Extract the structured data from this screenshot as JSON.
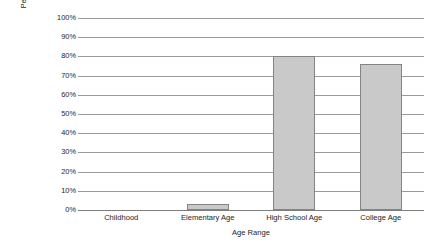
{
  "chart_data": {
    "type": "bar",
    "title": "",
    "subtitle": "",
    "categories": [
      "Childhood",
      "Elementary Age",
      "High School Age",
      "College Age"
    ],
    "values": [
      0,
      3,
      80,
      76
    ],
    "xlabel": "Age Range",
    "ylabel": "Percentage who reported SNS as favorite destination",
    "ylabel_lines": [
      "Percentage who reported SNS as",
      "favorite destination"
    ],
    "ylim": [
      0,
      100
    ],
    "ytick_values": [
      0,
      10,
      20,
      30,
      40,
      50,
      60,
      70,
      80,
      90,
      100
    ],
    "ytick_labels": [
      "0%",
      "10%",
      "20%",
      "30%",
      "40%",
      "50%",
      "60%",
      "70%",
      "80%",
      "90%",
      "100%"
    ],
    "grid": "horizontal",
    "legend": "none",
    "annotations": [],
    "colors": {
      "bar_fill": "#c9c9c9",
      "bar_stroke": "#848484",
      "gridline": "#9a9a9a",
      "axis": "#7d7d7d",
      "text": "#1d1d1d",
      "background": "#ffffff"
    }
  }
}
